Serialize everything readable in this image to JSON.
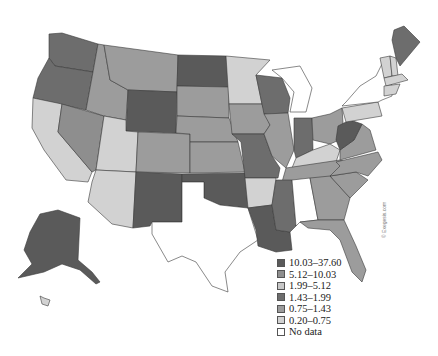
{
  "map": {
    "title": "",
    "type": "choropleth",
    "region": "United States",
    "credit": "© Exegesis.com",
    "colors": {
      "c1": "#5a5a5a",
      "c2": "#8e8e8e",
      "c3": "#c7c7c7",
      "c4": "#6d6d6d",
      "c5": "#9c9c9c",
      "c6": "#d2d2d2",
      "nodata": "#ffffff"
    }
  },
  "legend": {
    "items": [
      {
        "label": "10.03–37.60",
        "color": "#5a5a5a"
      },
      {
        "label": "5.12–10.03",
        "color": "#8e8e8e"
      },
      {
        "label": "1.99–5.12",
        "color": "#c7c7c7"
      },
      {
        "label": "1.43–1.99",
        "color": "#6d6d6d"
      },
      {
        "label": "0.75–1.43",
        "color": "#9c9c9c"
      },
      {
        "label": "0.20–0.75",
        "color": "#d2d2d2"
      },
      {
        "label": "No data",
        "color": "#ffffff"
      }
    ]
  },
  "states": {
    "WA": "c4",
    "OR": "c4",
    "CA": "c6",
    "NV": "c2",
    "ID": "c5",
    "MT": "c5",
    "WY": "c1",
    "UT": "c6",
    "AZ": "c6",
    "CO": "c5",
    "NM": "c1",
    "ND": "c1",
    "SD": "c5",
    "NE": "c5",
    "KS": "c5",
    "OK": "c1",
    "TX": "nodata",
    "MN": "c6",
    "IA": "c5",
    "MO": "c4",
    "AR": "c6",
    "LA": "c1",
    "WI": "c4",
    "IL": "c5",
    "MI": "nodata",
    "IN": "c4",
    "OH": "c5",
    "KY": "c6",
    "TN": "c5",
    "MS": "c4",
    "AL": "nodata",
    "GA": "c5",
    "FL": "c5",
    "SC": "c5",
    "NC": "c5",
    "VA": "c5",
    "WV": "c1",
    "PA": "c6",
    "NY": "nodata",
    "ME": "c4",
    "VT": "c6",
    "NH": "c6",
    "MA": "c6",
    "AK": "c1",
    "HI": "c6"
  }
}
